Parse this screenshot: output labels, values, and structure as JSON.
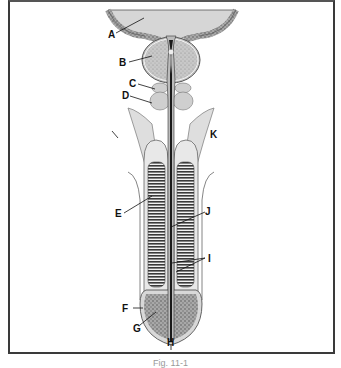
{
  "diagram": {
    "type": "anatomical cross-section",
    "frame": {
      "border_color": "#3a3a3a"
    },
    "colors": {
      "tissue_light": "#dcdcdc",
      "tissue_mid": "#bdbdbd",
      "tissue_dark": "#4a4a4a",
      "urethra": "#1e1e1e",
      "stipple": "#8a8a8a"
    },
    "labels": [
      {
        "id": "A",
        "text": "A"
      },
      {
        "id": "B",
        "text": "B"
      },
      {
        "id": "C",
        "text": "C"
      },
      {
        "id": "D",
        "text": "D"
      },
      {
        "id": "E",
        "text": "E"
      },
      {
        "id": "F",
        "text": "F"
      },
      {
        "id": "G",
        "text": "G"
      },
      {
        "id": "H",
        "text": "H"
      },
      {
        "id": "I",
        "text": "I"
      },
      {
        "id": "J",
        "text": "J"
      },
      {
        "id": "K",
        "text": "K"
      }
    ],
    "caption": "Fig. 11-1"
  }
}
